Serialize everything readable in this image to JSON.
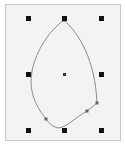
{
  "canvas": {
    "background": "#f3f3f3",
    "border": "#c8c8c8"
  },
  "selection": {
    "handle_color": "#111111",
    "handles": [
      {
        "name": "handle-top-left",
        "x": 28,
        "y": 18
      },
      {
        "name": "handle-top-center",
        "x": 64,
        "y": 18
      },
      {
        "name": "handle-top-right",
        "x": 101,
        "y": 18
      },
      {
        "name": "handle-middle-left",
        "x": 28,
        "y": 74
      },
      {
        "name": "handle-middle-right",
        "x": 101,
        "y": 74
      },
      {
        "name": "handle-bottom-left",
        "x": 28,
        "y": 130
      },
      {
        "name": "handle-bottom-center",
        "x": 64,
        "y": 130
      },
      {
        "name": "handle-bottom-right",
        "x": 101,
        "y": 130
      }
    ],
    "center": {
      "x": 64,
      "y": 74
    }
  },
  "shape": {
    "stroke": "#8a8a8a",
    "anchor_points": [
      {
        "x": 64,
        "y": 20
      },
      {
        "x": 97,
        "y": 103
      },
      {
        "x": 87,
        "y": 111
      },
      {
        "x": 59,
        "y": 128
      },
      {
        "x": 46,
        "y": 119
      },
      {
        "x": 32,
        "y": 71
      }
    ]
  }
}
